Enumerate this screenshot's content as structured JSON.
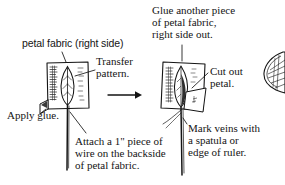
{
  "figure": {
    "ink_color": "#141414",
    "paper_color": "#ffffff"
  },
  "captions": {
    "petal_fabric": "petal fabric (right side)",
    "transfer_pattern": "Transfer\npattern.",
    "apply_glue": "Apply glue.",
    "attach_wire": "Attach a 1\"  piece of\nwire on the backside\nof petal fabric.",
    "glue_another": "Glue another piece\nof petal fabric,\nright side out.",
    "cut_out_petal": "Cut out\npetal.",
    "mark_veins": "Mark veins with\na spatula or\nedge of ruler."
  },
  "panels": {
    "left": {
      "name": "step-1-transfer-pattern",
      "description": "Square of petal fabric with leaf-shaped pattern traced on it, hatch shading at left edge, folded-up corner at lower left, wire extending below."
    },
    "right": {
      "name": "step-2-cut-and-vein",
      "description": "Second square of petal fabric glued on top, petal being cut out, wire below, veins being marked."
    },
    "far_right": {
      "name": "finished-petal-fragment",
      "description": "Partially visible veined petal at right edge of image."
    }
  },
  "arrow": {
    "name": "step-arrow",
    "direction": "right",
    "label": ""
  }
}
